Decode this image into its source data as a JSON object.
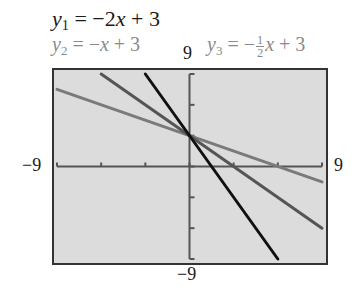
{
  "equations": {
    "y1": {
      "lhs": "y",
      "sub": "1",
      "rhs_pre": " = −2",
      "var": "x",
      "rhs_post": " + 3"
    },
    "y2": {
      "lhs": "y",
      "sub": "2",
      "rhs_pre": " = −",
      "var": "x",
      "rhs_post": " + 3"
    },
    "y3": {
      "lhs": "y",
      "sub": "3",
      "rhs_pre": " = −",
      "num": "1",
      "den": "2",
      "var": "x",
      "rhs_post": " + 3"
    }
  },
  "window": {
    "ymax_label": "9",
    "ymin_label": "−9",
    "xmin_label": "−9",
    "xmax_label": "9"
  },
  "colors": {
    "y1": "#111111",
    "y2": "#555555",
    "y3": "#7a7a7a",
    "screen": "#dcdcdc",
    "frame": "#333333",
    "axes": "#555555"
  },
  "chart_data": {
    "type": "line",
    "title": "",
    "xlabel": "",
    "ylabel": "",
    "xlim": [
      -9,
      9
    ],
    "ylim": [
      -9,
      9
    ],
    "xscl": 3,
    "yscl": 3,
    "grid": false,
    "series": [
      {
        "name": "y1 = -2x + 3",
        "slope": -2,
        "intercept": 3,
        "x": [
          -3,
          6
        ],
        "y": [
          9,
          -9
        ]
      },
      {
        "name": "y2 = -x + 3",
        "slope": -1,
        "intercept": 3,
        "x": [
          -6,
          9
        ],
        "y": [
          9,
          -6
        ]
      },
      {
        "name": "y3 = -1/2 x + 3",
        "slope": -0.5,
        "intercept": 3,
        "x": [
          -9,
          9
        ],
        "y": [
          7.5,
          -1.5
        ]
      }
    ]
  }
}
